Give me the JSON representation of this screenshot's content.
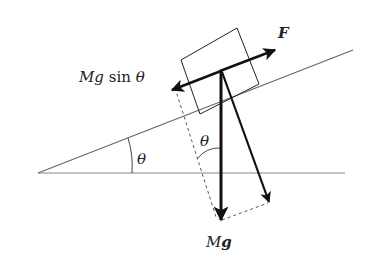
{
  "diagram": {
    "type": "inclined-plane-force-diagram",
    "labels": {
      "applied_force": "F",
      "parallel_component": "Mg sin θ",
      "parallel_component_mg": "Mg",
      "parallel_component_sin": "sin",
      "parallel_component_theta": "θ",
      "incline_angle": "θ",
      "weight_angle": "θ",
      "weight": "Mg",
      "weight_m": "M",
      "weight_g": "g"
    },
    "colors": {
      "line": "#222222",
      "ground": "#777766",
      "incline": "#666666",
      "dashed": "#444444"
    }
  }
}
